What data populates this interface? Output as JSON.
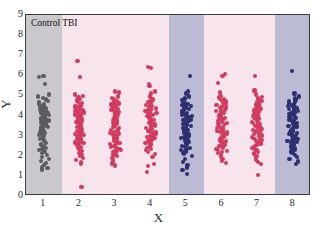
{
  "figure": {
    "panel_label": "Control TBI",
    "background_color": "#ffffff",
    "frame_color": "#3a3a44"
  },
  "chart_data": {
    "type": "scatter",
    "title": "Control TBI",
    "xlabel": "X",
    "ylabel": "Y",
    "xlim": [
      0.5,
      8.5
    ],
    "ylim": [
      0,
      9
    ],
    "yticks": [
      0,
      1,
      2,
      3,
      4,
      5,
      6,
      7,
      8,
      9
    ],
    "xticks": [
      1,
      2,
      3,
      4,
      5,
      6,
      7,
      8
    ],
    "grid": false,
    "legend": "none",
    "plot_style": "jittered strip plot / scatter by category",
    "band_colors": {
      "gray": "#c9c9cd",
      "pink": "#f7e4ec",
      "lavender": "#bcbbd4"
    },
    "bands": [
      {
        "from": 0.5,
        "to": 1.5,
        "color": "#c9c9cd",
        "name": "band-gray-1"
      },
      {
        "from": 1.5,
        "to": 4.5,
        "color": "#f7e4ec",
        "name": "band-pink-2-4"
      },
      {
        "from": 4.5,
        "to": 5.5,
        "color": "#bcbbd4",
        "name": "band-lavender-5"
      },
      {
        "from": 5.5,
        "to": 7.5,
        "color": "#f7e4ec",
        "name": "band-pink-6-7"
      },
      {
        "from": 7.5,
        "to": 8.5,
        "color": "#bcbbd4",
        "name": "band-lavender-8"
      }
    ],
    "series": [
      {
        "name": "Group 1",
        "x": 1,
        "color": "#5b5b60",
        "values": [
          5.95,
          5.92,
          5.55,
          5.05,
          4.95,
          4.88,
          4.8,
          4.72,
          4.65,
          4.6,
          4.55,
          4.5,
          4.48,
          4.45,
          4.4,
          4.38,
          4.35,
          4.3,
          4.28,
          4.25,
          4.22,
          4.2,
          4.18,
          4.15,
          4.12,
          4.1,
          4.08,
          4.05,
          4.02,
          4.0,
          3.98,
          3.95,
          3.92,
          3.9,
          3.88,
          3.85,
          3.82,
          3.8,
          3.78,
          3.75,
          3.72,
          3.7,
          3.68,
          3.65,
          3.62,
          3.6,
          3.58,
          3.55,
          3.52,
          3.5,
          3.48,
          3.45,
          3.42,
          3.4,
          3.38,
          3.35,
          3.32,
          3.3,
          3.25,
          3.2,
          3.15,
          3.1,
          3.05,
          3.0,
          2.95,
          2.9,
          2.85,
          2.8,
          2.75,
          2.7,
          2.65,
          2.6,
          2.55,
          2.5,
          2.45,
          2.4,
          2.35,
          2.3,
          2.25,
          2.2,
          2.12,
          2.05,
          1.95,
          1.85,
          1.75,
          1.65,
          1.55,
          1.45,
          1.38,
          1.32
        ]
      },
      {
        "name": "Group 2",
        "x": 2,
        "color": "#d43a5e",
        "values": [
          6.7,
          5.9,
          5.05,
          4.98,
          4.9,
          4.82,
          4.75,
          4.68,
          4.62,
          4.58,
          4.52,
          4.48,
          4.45,
          4.42,
          4.38,
          4.35,
          4.3,
          4.27,
          4.24,
          4.2,
          4.18,
          4.15,
          4.12,
          4.08,
          4.05,
          4.02,
          4.0,
          3.97,
          3.94,
          3.9,
          3.88,
          3.85,
          3.82,
          3.78,
          3.75,
          3.72,
          3.68,
          3.65,
          3.6,
          3.55,
          3.5,
          3.46,
          3.42,
          3.38,
          3.34,
          3.3,
          3.26,
          3.22,
          3.18,
          3.14,
          3.1,
          3.06,
          3.02,
          2.98,
          2.94,
          2.9,
          2.86,
          2.82,
          2.78,
          2.74,
          2.7,
          2.66,
          2.62,
          2.58,
          2.54,
          2.5,
          2.45,
          2.4,
          2.35,
          2.3,
          2.25,
          2.2,
          2.15,
          2.1,
          2.05,
          2.0,
          1.9,
          1.8,
          1.7,
          1.62,
          0.45
        ]
      },
      {
        "name": "Group 3",
        "x": 3,
        "color": "#d43a5e",
        "values": [
          5.2,
          5.15,
          4.95,
          4.88,
          4.8,
          4.72,
          4.65,
          4.6,
          4.55,
          4.5,
          4.45,
          4.4,
          4.36,
          4.32,
          4.28,
          4.24,
          4.2,
          4.16,
          4.12,
          4.08,
          4.05,
          4.02,
          3.98,
          3.95,
          3.92,
          3.88,
          3.85,
          3.82,
          3.78,
          3.75,
          3.72,
          3.68,
          3.65,
          3.62,
          3.58,
          3.55,
          3.5,
          3.46,
          3.42,
          3.38,
          3.34,
          3.3,
          3.26,
          3.22,
          3.18,
          3.14,
          3.1,
          3.06,
          3.02,
          2.98,
          2.94,
          2.9,
          2.86,
          2.82,
          2.78,
          2.74,
          2.7,
          2.66,
          2.62,
          2.58,
          2.54,
          2.5,
          2.46,
          2.42,
          2.38,
          2.34,
          2.3,
          2.26,
          2.22,
          2.18,
          2.14,
          2.1,
          2.05,
          2.0,
          1.95,
          1.88,
          1.8,
          1.72,
          1.62,
          1.52
        ]
      },
      {
        "name": "Group 4",
        "x": 4,
        "color": "#d43a5e",
        "values": [
          6.4,
          6.35,
          5.55,
          5.48,
          5.2,
          5.1,
          4.95,
          4.88,
          4.8,
          4.74,
          4.68,
          4.62,
          4.58,
          4.52,
          4.48,
          4.44,
          4.4,
          4.35,
          4.3,
          4.26,
          4.22,
          4.18,
          4.14,
          4.1,
          4.06,
          4.02,
          3.98,
          3.95,
          3.92,
          3.88,
          3.84,
          3.8,
          3.76,
          3.72,
          3.68,
          3.64,
          3.6,
          3.56,
          3.52,
          3.48,
          3.44,
          3.4,
          3.36,
          3.32,
          3.28,
          3.24,
          3.2,
          3.16,
          3.12,
          3.08,
          3.04,
          3.0,
          2.96,
          2.92,
          2.88,
          2.84,
          2.8,
          2.76,
          2.72,
          2.68,
          2.64,
          2.6,
          2.55,
          2.5,
          2.45,
          2.4,
          2.35,
          2.28,
          2.2,
          2.1,
          1.95,
          1.6,
          1.48,
          1.2
        ]
      },
      {
        "name": "Group 5",
        "x": 5,
        "color": "#2e2e70",
        "values": [
          5.95,
          5.2,
          5.1,
          4.95,
          4.88,
          4.82,
          4.76,
          4.7,
          4.64,
          4.58,
          4.52,
          4.48,
          4.44,
          4.4,
          4.36,
          4.32,
          4.28,
          4.24,
          4.2,
          4.16,
          4.12,
          4.08,
          4.04,
          4.0,
          3.96,
          3.92,
          3.88,
          3.84,
          3.8,
          3.76,
          3.72,
          3.68,
          3.64,
          3.6,
          3.56,
          3.52,
          3.48,
          3.44,
          3.4,
          3.36,
          3.32,
          3.28,
          3.24,
          3.2,
          3.16,
          3.12,
          3.08,
          3.04,
          3.0,
          2.96,
          2.92,
          2.88,
          2.84,
          2.8,
          2.76,
          2.72,
          2.68,
          2.64,
          2.6,
          2.55,
          2.5,
          2.45,
          2.4,
          2.35,
          2.3,
          2.25,
          2.2,
          2.15,
          2.1,
          2.0,
          1.85,
          1.7,
          1.55,
          1.42,
          1.28,
          1.1
        ]
      },
      {
        "name": "Group 6",
        "x": 6,
        "color": "#d43a5e",
        "values": [
          6.05,
          5.95,
          5.6,
          5.15,
          4.98,
          4.9,
          4.82,
          4.76,
          4.7,
          4.64,
          4.58,
          4.52,
          4.48,
          4.44,
          4.4,
          4.36,
          4.32,
          4.28,
          4.24,
          4.2,
          4.16,
          4.12,
          4.08,
          4.04,
          4.0,
          3.96,
          3.92,
          3.88,
          3.84,
          3.8,
          3.76,
          3.72,
          3.68,
          3.64,
          3.6,
          3.56,
          3.52,
          3.48,
          3.44,
          3.4,
          3.36,
          3.32,
          3.28,
          3.24,
          3.2,
          3.16,
          3.12,
          3.08,
          3.04,
          3.0,
          2.96,
          2.92,
          2.88,
          2.84,
          2.8,
          2.76,
          2.72,
          2.68,
          2.64,
          2.6,
          2.55,
          2.5,
          2.45,
          2.4,
          2.35,
          2.3,
          2.25,
          2.2,
          2.12,
          2.05,
          1.95,
          1.85,
          1.75,
          1.65
        ]
      },
      {
        "name": "Group 7",
        "x": 7,
        "color": "#d43a5e",
        "values": [
          5.98,
          5.25,
          5.05,
          4.92,
          4.85,
          4.78,
          4.72,
          4.66,
          4.6,
          4.55,
          4.5,
          4.45,
          4.41,
          4.37,
          4.33,
          4.29,
          4.25,
          4.21,
          4.17,
          4.13,
          4.09,
          4.05,
          4.01,
          3.97,
          3.93,
          3.89,
          3.85,
          3.81,
          3.77,
          3.73,
          3.69,
          3.65,
          3.61,
          3.57,
          3.53,
          3.49,
          3.45,
          3.41,
          3.37,
          3.33,
          3.29,
          3.25,
          3.21,
          3.17,
          3.13,
          3.09,
          3.05,
          3.01,
          2.97,
          2.93,
          2.89,
          2.85,
          2.81,
          2.77,
          2.73,
          2.69,
          2.65,
          2.6,
          2.55,
          2.5,
          2.45,
          2.4,
          2.35,
          2.3,
          2.25,
          2.2,
          2.15,
          2.08,
          2.0,
          1.9,
          1.8,
          1.7,
          1.6,
          1.05
        ]
      },
      {
        "name": "Group 8",
        "x": 8,
        "color": "#2e2e70",
        "values": [
          6.2,
          5.1,
          4.95,
          4.88,
          4.8,
          4.74,
          4.68,
          4.62,
          4.56,
          4.5,
          4.46,
          4.42,
          4.38,
          4.34,
          4.3,
          4.26,
          4.22,
          4.18,
          4.14,
          4.1,
          4.06,
          4.02,
          3.98,
          3.94,
          3.9,
          3.86,
          3.82,
          3.78,
          3.74,
          3.7,
          3.66,
          3.62,
          3.58,
          3.54,
          3.5,
          3.46,
          3.42,
          3.38,
          3.34,
          3.3,
          3.26,
          3.22,
          3.18,
          3.14,
          3.1,
          3.06,
          3.02,
          2.98,
          2.94,
          2.9,
          2.86,
          2.82,
          2.78,
          2.74,
          2.7,
          2.66,
          2.62,
          2.58,
          2.54,
          2.5,
          2.45,
          2.4,
          2.35,
          2.3,
          2.25,
          2.2,
          2.12,
          2.05,
          1.95,
          1.85,
          1.72,
          1.6
        ]
      }
    ]
  }
}
